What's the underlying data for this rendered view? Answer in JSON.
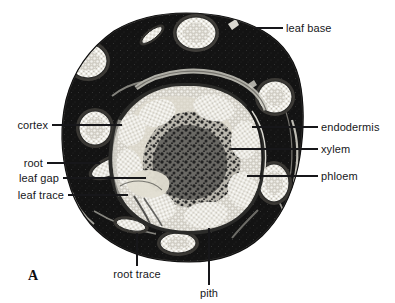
{
  "figure": {
    "panel_letter": "A",
    "background_color": "#ffffff",
    "ink_color": "#17171a",
    "specimen": {
      "outline_color": "#141414",
      "cortex_color": "#141414",
      "stele_color": "#d8d6cf",
      "bundle_color": "#efede6"
    }
  },
  "labels": {
    "leaf_base": "leaf base",
    "endodermis": "endodermis",
    "xylem": "xylem",
    "phloem": "phloem",
    "cortex": "cortex",
    "root": "root",
    "leaf_gap": "leaf gap",
    "leaf_trace": "leaf  trace",
    "root_trace": "root trace",
    "pith": "pith"
  }
}
